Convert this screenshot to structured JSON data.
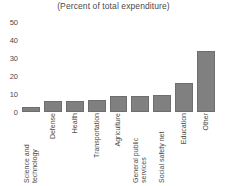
{
  "chart_data": {
    "type": "bar",
    "title": "(Percent of total expenditure)",
    "subtitle": "",
    "xlabel": "",
    "ylabel": "",
    "ylim": [
      0,
      50
    ],
    "yticks": [
      0,
      10,
      20,
      30,
      40,
      50
    ],
    "ytick_labels": [
      "0",
      "10",
      "20",
      "30",
      "40",
      "50"
    ],
    "grid": false,
    "legend": false,
    "bar_color": "#808080",
    "bar_edge_color": "#6e6e6e",
    "categories": [
      "Science and technology",
      "Defense",
      "Health",
      "Transportation",
      "Agriculture",
      "General public services",
      "Social safety net",
      "Education",
      "Other"
    ],
    "values": [
      3,
      6,
      6,
      6.5,
      9,
      9,
      9.5,
      16,
      34
    ]
  },
  "ytick_labels": {
    "t0": "50",
    "t1": "40",
    "t2": "30",
    "t3": "20",
    "t4": "10",
    "t5": "0"
  },
  "categories": {
    "c0": "Science and technology",
    "c1": "Defense",
    "c2": "Health",
    "c3": "Transportation",
    "c4": "Agriculture",
    "c5": "General public services",
    "c6": "Social safety net",
    "c7": "Education",
    "c8": "Other"
  }
}
